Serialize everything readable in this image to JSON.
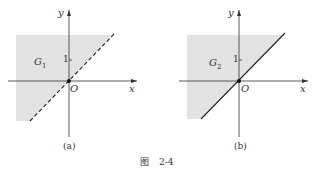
{
  "figure": {
    "caption_prefix": "图",
    "caption_number": "2-4",
    "panels": [
      {
        "id": "a",
        "label": "(a)",
        "region_label": "G",
        "region_subscript": "1",
        "boundary_style": "dashed",
        "x_axis_label": "x",
        "y_axis_label": "y",
        "origin_label": "O",
        "tick_label": "1"
      },
      {
        "id": "b",
        "label": "(b)",
        "region_label": "G",
        "region_subscript": "2",
        "boundary_style": "solid",
        "x_axis_label": "x",
        "y_axis_label": "y",
        "origin_label": "O",
        "tick_label": "1"
      }
    ],
    "colors": {
      "shade": "#e3e3e3",
      "line": "#222222"
    }
  }
}
